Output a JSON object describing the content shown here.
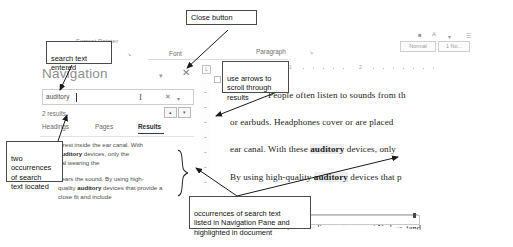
{
  "annotations": [
    {
      "id": "close-button",
      "text": "Close button"
    },
    {
      "id": "search-text",
      "text": "search text\nentered"
    },
    {
      "id": "use-arrows",
      "text": "use arrows to\nscroll through\nresults"
    },
    {
      "id": "two-occurrences",
      "text": "two\noccurrences\nof search\ntext located"
    },
    {
      "id": "occurrences-listed",
      "text": "occurrences of search text\nlisted in Navigation Pane and\nhighlighted in document"
    }
  ],
  "ribbon": {
    "format_painter": "Format Painter",
    "clipboard_dialog": "↘",
    "font_group": "Font",
    "font_dialog": "↘",
    "paragraph_group": "Paragraph",
    "paragraph_dialog": "↘",
    "style_normal": "Normal",
    "style_nospacing": "1 No..."
  },
  "navigation": {
    "title": "Navigation",
    "collapse_icon": "▾",
    "close_icon": "✕",
    "search_value": "auditory",
    "search_placeholder": "Search document",
    "clear_icon": "✕",
    "dropdown_icon": "▾",
    "results_count": "2 results",
    "prev_icon": "▴",
    "next_icon": "▾",
    "tabs": [
      {
        "label": "Headings",
        "active": false
      },
      {
        "label": "Pages",
        "active": false
      },
      {
        "label": "Results",
        "active": true
      }
    ],
    "results": [
      {
        "line1_pre": "s rest inside the ear canal. With ",
        "line2_bold": "auditory",
        "line2_post": " devices, only the",
        "line3": "ual wearing the"
      },
      {
        "line1": "hears the sound. By using high-",
        "line2_pre": "quality ",
        "line2_bold": "auditory",
        "line2_post": " devices that provide a",
        "line3": "close fit and include"
      }
    ]
  },
  "document": {
    "ruler_numbers": [
      "1",
      "2"
    ],
    "lines": [
      {
        "text": "People often listen to sounds from th",
        "bold_term": ""
      },
      {
        "text": "or earbuds. Headphones cover or are placed",
        "bold_term": ""
      },
      {
        "pre": "ear canal. With these ",
        "bold": "auditory",
        "post": " devices, only"
      },
      {
        "pre": "By using high-quality ",
        "bold": "auditory",
        "post": " devices that p"
      }
    ],
    "footnote": "1. According to Clark and Nadeer, tend"
  },
  "colors": {
    "annotation_border": "#4a4a4a",
    "pane_text": "#6f6f6f",
    "doc_text": "#1c1c1c",
    "highlight": "#eeeeee"
  }
}
